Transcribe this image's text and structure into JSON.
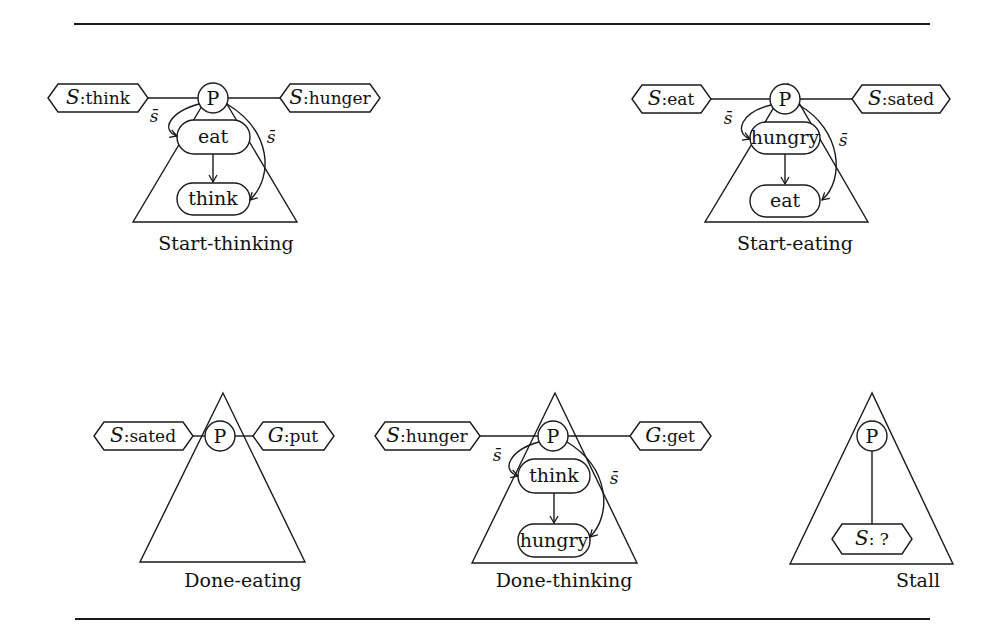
{
  "figure": {
    "diagrams": [
      {
        "id": "start-thinking",
        "caption": "Start-thinking",
        "root": "P",
        "left_tag": {
          "prefix": "S",
          "sep": ":",
          "value": "think"
        },
        "right_tag": {
          "prefix": "S",
          "sep": ":",
          "value": "hunger"
        },
        "nodes": [
          "eat",
          "think"
        ],
        "edge_labels": [
          "s̄",
          "s̄"
        ]
      },
      {
        "id": "start-eating",
        "caption": "Start-eating",
        "root": "P",
        "left_tag": {
          "prefix": "S",
          "sep": ":",
          "value": "eat"
        },
        "right_tag": {
          "prefix": "S",
          "sep": ":",
          "value": "sated"
        },
        "nodes": [
          "hungry",
          "eat"
        ],
        "edge_labels": [
          "s̄",
          "s̄"
        ]
      },
      {
        "id": "done-eating",
        "caption": "Done-eating",
        "root": "P",
        "left_tag": {
          "prefix": "S",
          "sep": ":",
          "value": "sated"
        },
        "right_tag": {
          "prefix": "G",
          "sep": ":",
          "value": "put"
        },
        "nodes": [],
        "edge_labels": []
      },
      {
        "id": "done-thinking",
        "caption": "Done-thinking",
        "root": "P",
        "left_tag": {
          "prefix": "S",
          "sep": ":",
          "value": "hunger"
        },
        "right_tag": {
          "prefix": "G",
          "sep": ":",
          "value": "get"
        },
        "nodes": [
          "think",
          "hungry"
        ],
        "edge_labels": [
          "s̄",
          "s̄"
        ]
      },
      {
        "id": "stall",
        "caption": "Stall",
        "root": "P",
        "bottom_tag": {
          "prefix": "S",
          "sep": ": ",
          "value": "?"
        },
        "nodes": [],
        "edge_labels": []
      }
    ]
  }
}
